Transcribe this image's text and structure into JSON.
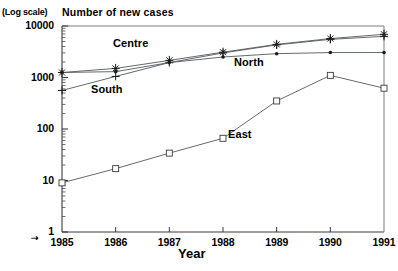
{
  "chart_data": {
    "type": "line",
    "title": "Number of new cases",
    "scale_note": "(Log scale)",
    "xlabel": "Year",
    "ylabel": "",
    "yscale": "log",
    "ylim": [
      1,
      10000
    ],
    "ytick_labels": [
      "10000",
      "1000",
      "100",
      "10",
      "1"
    ],
    "ytick_values": [
      10000,
      1000,
      100,
      10,
      1
    ],
    "grid": false,
    "legend_position": "inline-annotations",
    "categories": [
      "1985",
      "1986",
      "1987",
      "1988",
      "1989",
      "1990",
      "1991"
    ],
    "x": [
      1985,
      1986,
      1987,
      1988,
      1989,
      1990,
      1991
    ],
    "series": [
      {
        "name": "Centre",
        "marker": "asterisk",
        "values": [
          1250,
          1500,
          2150,
          3100,
          4400,
          5700,
          6900
        ]
      },
      {
        "name": "South",
        "marker": "plus",
        "values": [
          560,
          1050,
          1950,
          3000,
          4300,
          5500,
          6300
        ]
      },
      {
        "name": "North",
        "marker": "dot",
        "values": [
          1250,
          1300,
          1950,
          2500,
          2900,
          3050,
          3050
        ]
      },
      {
        "name": "East",
        "marker": "square",
        "values": [
          9,
          17,
          34,
          66,
          350,
          1100,
          620
        ]
      }
    ],
    "annotations": [
      {
        "text": "Centre",
        "x_px": 113,
        "y_px": 37
      },
      {
        "text": "South",
        "x_px": 91,
        "y_px": 83
      },
      {
        "text": "North",
        "x_px": 234,
        "y_px": 56
      },
      {
        "text": "East",
        "x_px": 228,
        "y_px": 128
      }
    ],
    "origin_marker": "⇢"
  },
  "axis_geometry": {
    "plot_left_px": 62,
    "plot_right_px": 384,
    "plot_top_px": 26,
    "plot_bottom_px": 232
  }
}
